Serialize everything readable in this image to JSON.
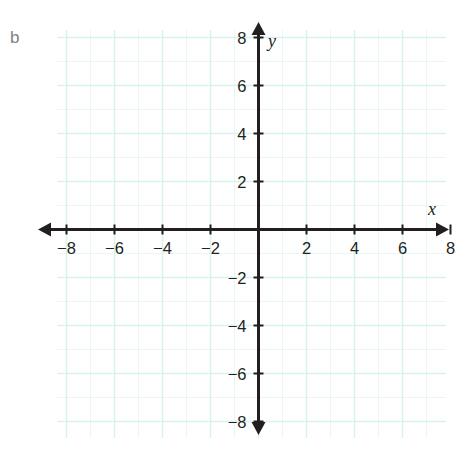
{
  "figure": {
    "part_label": "b",
    "background_color": "#ffffff"
  },
  "chart_data": {
    "type": "line",
    "title": "",
    "subtitle": "",
    "xlabel": "x",
    "ylabel": "y",
    "grid": true,
    "grid_color": "#d6f2ef",
    "grid_step": 1,
    "grid_major_step": 2,
    "axis_color": "#231f20",
    "curve_color": "#8fe6c4",
    "legend": null,
    "legend_position": "none",
    "xlim": [
      -9.2,
      9.7
    ],
    "ylim": [
      -9.7,
      9.2
    ],
    "xticks": [
      -8,
      -6,
      -4,
      -2,
      2,
      4,
      6,
      8
    ],
    "xtick_labels": [
      "−8",
      "−6",
      "−4",
      "−2",
      "2",
      "4",
      "6",
      "8"
    ],
    "yticks": [
      8,
      6,
      4,
      2,
      -2,
      -4,
      -6,
      -8
    ],
    "ytick_labels": [
      "8",
      "6",
      "4",
      "2",
      "−2",
      "−4",
      "−6",
      "−8"
    ],
    "series": [
      {
        "name": "parabola",
        "equation": "y = -0.3(x - 2)^2 + 4.8",
        "vertex": [
          2,
          4.8
        ],
        "y_intercept": 4,
        "x_intercepts": [
          -2,
          6
        ],
        "opens": "down",
        "x": [
          -3.2,
          -3.0,
          -2.5,
          -2.0,
          -1.5,
          -1.0,
          -0.5,
          0.0,
          0.5,
          1.0,
          1.5,
          2.0,
          2.5,
          3.0,
          3.5,
          4.0,
          4.5,
          5.0,
          5.5,
          6.0,
          6.5,
          7.0,
          7.5,
          8.0,
          8.4
        ],
        "y": [
          -3.85,
          -2.7,
          -0.28,
          1.0,
          1.93,
          2.08,
          3.0,
          4.0,
          4.13,
          4.5,
          4.73,
          4.8,
          4.73,
          4.5,
          4.13,
          3.6,
          2.93,
          2.1,
          1.13,
          0.0,
          -1.28,
          -2.7,
          -4.28,
          -6.0,
          -7.49
        ]
      }
    ],
    "annotations": []
  }
}
